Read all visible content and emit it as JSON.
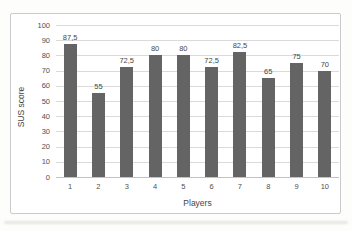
{
  "chart_data": {
    "type": "bar",
    "xlabel": "Players",
    "ylabel": "SUS score",
    "categories": [
      "1",
      "2",
      "3",
      "4",
      "5",
      "6",
      "7",
      "8",
      "9",
      "10"
    ],
    "values": [
      87.5,
      55,
      72.5,
      80,
      80,
      72.5,
      82.5,
      65,
      75,
      70
    ],
    "value_labels": [
      "87,5",
      "55",
      "72,5",
      "80",
      "80",
      "72,5",
      "82,5",
      "65",
      "75",
      "70"
    ],
    "ylim": [
      0,
      100
    ],
    "yticks": [
      0,
      10,
      20,
      30,
      40,
      50,
      60,
      70,
      80,
      90,
      100
    ],
    "grid": "horizontal",
    "legend": "none",
    "colors": {
      "bar": "#646464",
      "gridline": "#dadada",
      "axis_line": "#c3c3c3",
      "tick_text": "#4f4f4f",
      "value_text": "#474747",
      "axis_title_text": "#454545",
      "chart_border": "#cbcbcb",
      "chart_background": "#ffffff"
    }
  }
}
